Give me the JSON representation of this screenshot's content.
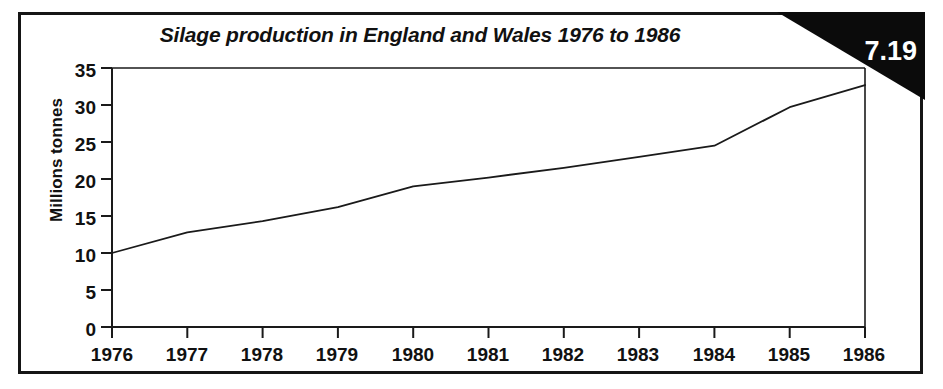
{
  "figure": {
    "number_badge": "7.19",
    "title": "Silage production in England and Wales 1976 to 1986",
    "frame_color": "#151515",
    "badge_color": "#0b0b0b",
    "line_color": "#1a1a1a",
    "background": "#ffffff"
  },
  "chart_data": {
    "type": "line",
    "title": "Silage production in England and Wales 1976 to 1986",
    "xlabel": "",
    "ylabel": "Millions tonnes",
    "x": [
      1976,
      1977,
      1978,
      1979,
      1980,
      1981,
      1982,
      1983,
      1984,
      1985,
      1986
    ],
    "categories": [
      "1976",
      "1977",
      "1978",
      "1979",
      "1980",
      "1981",
      "1982",
      "1983",
      "1984",
      "1985",
      "1986"
    ],
    "values": [
      10.0,
      12.8,
      14.3,
      16.2,
      19.0,
      20.2,
      21.5,
      23.0,
      24.5,
      29.7,
      32.7
    ],
    "series": [
      {
        "name": "Silage production",
        "values": [
          10.0,
          12.8,
          14.3,
          16.2,
          19.0,
          20.2,
          21.5,
          23.0,
          24.5,
          29.7,
          32.7
        ]
      }
    ],
    "ylim": [
      0,
      35
    ],
    "xlim": [
      1976,
      1986
    ],
    "yticks": [
      0,
      5,
      10,
      15,
      20,
      25,
      30,
      35
    ],
    "ytick_labels": [
      "0",
      "5",
      "10",
      "15",
      "20",
      "25",
      "30",
      "35"
    ],
    "xticks": [
      1976,
      1977,
      1978,
      1979,
      1980,
      1981,
      1982,
      1983,
      1984,
      1985,
      1986
    ],
    "xtick_labels": [
      "1976",
      "1977",
      "1978",
      "1979",
      "1980",
      "1981",
      "1982",
      "1983",
      "1984",
      "1985",
      "1986"
    ],
    "grid": false,
    "legend": false,
    "units": "Millions tonnes"
  }
}
